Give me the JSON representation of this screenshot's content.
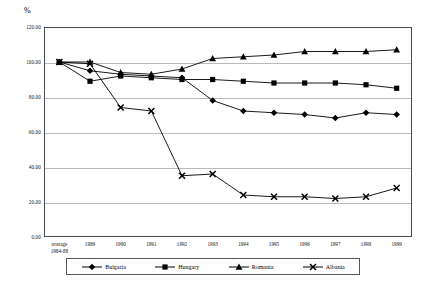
{
  "chart_data": {
    "type": "line",
    "title": "",
    "subtitle": "",
    "xlabel": "",
    "ylabel": "%",
    "ylim": [
      0,
      120
    ],
    "yticks": [
      "0.00",
      "20.00",
      "40.00",
      "60.00",
      "80.00",
      "100.00",
      "120.00"
    ],
    "ytick_values": [
      0,
      20,
      40,
      60,
      80,
      100,
      120
    ],
    "grid": true,
    "legend_position": "bottom",
    "categories": [
      "average\n1984-88",
      "1989",
      "1990",
      "1991",
      "1992",
      "1993",
      "1994",
      "1995",
      "1996",
      "1997",
      "1998",
      "1999"
    ],
    "series": [
      {
        "name": "Bulgaria",
        "marker": "diamond",
        "color": "#000000",
        "values": [
          100,
          95,
          93,
          92,
          91,
          78,
          72,
          71,
          70,
          68,
          71,
          70
        ]
      },
      {
        "name": "Hungary",
        "marker": "square",
        "color": "#000000",
        "values": [
          100,
          89,
          92,
          91,
          90,
          90,
          89,
          88,
          88,
          88,
          87,
          85
        ]
      },
      {
        "name": "Romania",
        "marker": "triangle",
        "color": "#000000",
        "values": [
          100,
          100,
          94,
          93,
          96,
          102,
          103,
          104,
          106,
          106,
          106,
          107
        ]
      },
      {
        "name": "Albania",
        "marker": "cross",
        "color": "#000000",
        "values": [
          100,
          99,
          74,
          72,
          35,
          36,
          24,
          23,
          23,
          22,
          23,
          28
        ]
      }
    ]
  },
  "axis": {
    "unit_label": "%"
  },
  "legend": {
    "items": [
      {
        "label": "Bulgaria",
        "marker": "diamond"
      },
      {
        "label": "Hungary",
        "marker": "square"
      },
      {
        "label": "Romania",
        "marker": "triangle"
      },
      {
        "label": "Albania",
        "marker": "cross"
      }
    ]
  }
}
